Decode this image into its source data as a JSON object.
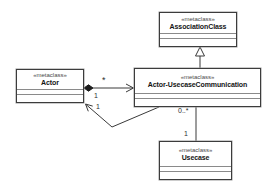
{
  "diagram": {
    "type": "uml-class-diagram",
    "classes": {
      "association_class": {
        "stereotype": "«metaclass»",
        "name": "AssociationClass"
      },
      "actor": {
        "stereotype": "«metaclass»",
        "name": "Actor"
      },
      "communication": {
        "stereotype": "«metaclass»",
        "name": "Actor-UsecaseCommunication"
      },
      "usecase": {
        "stereotype": "«metaclass»",
        "name": "Usecase"
      }
    },
    "labels": {
      "actor_comm_mult_actor_end": "1",
      "comm_actor_loop_mult": "1",
      "actor_comm_mult_comm_end": "*",
      "comm_usecase_mult_comm_end": "0..*",
      "comm_usecase_mult_usecase_end": "1"
    },
    "colors": {
      "line": "#3a3a3a",
      "box_border": "#3c3c3c",
      "box_background": "#ffffff",
      "name_text": "#141414",
      "stereotype_text": "#4a4a4a",
      "compartment_separator": "#8a8a8a"
    }
  }
}
